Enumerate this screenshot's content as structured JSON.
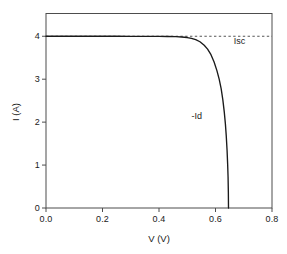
{
  "chart_data": {
    "type": "line",
    "title": "",
    "xlabel": "V (V)",
    "ylabel": "I (A)",
    "xlim": [
      0.0,
      0.8
    ],
    "ylim": [
      0.0,
      4.53
    ],
    "xticks": [
      "0.0",
      "0.2",
      "0.4",
      "0.6",
      "0.8"
    ],
    "xtick_values": [
      0.0,
      0.2,
      0.4,
      0.6,
      0.8
    ],
    "yticks": [
      "0",
      "1",
      "2",
      "3",
      "4"
    ],
    "ytick_values": [
      0,
      1,
      2,
      3,
      4
    ],
    "grid": false,
    "legend": "none",
    "series": [
      {
        "name": "-Id",
        "style": "solid",
        "color": "#1a1a1a",
        "x": [
          0.0,
          0.05,
          0.1,
          0.15,
          0.2,
          0.25,
          0.3,
          0.35,
          0.4,
          0.43,
          0.46,
          0.48,
          0.5,
          0.515,
          0.53,
          0.545,
          0.56,
          0.572,
          0.584,
          0.595,
          0.605,
          0.613,
          0.62,
          0.626,
          0.631,
          0.635,
          0.638,
          0.641,
          0.643,
          0.6445,
          0.6455,
          0.646
        ],
        "y": [
          4.0,
          4.0,
          4.0,
          4.0,
          4.0,
          4.0,
          3.999,
          3.999,
          3.997,
          3.995,
          3.99,
          3.983,
          3.97,
          3.952,
          3.922,
          3.872,
          3.79,
          3.7,
          3.57,
          3.4,
          3.2,
          3.0,
          2.78,
          2.52,
          2.24,
          1.96,
          1.69,
          1.34,
          1.02,
          0.72,
          0.37,
          0.0
        ]
      },
      {
        "name": "Isc",
        "style": "dashed",
        "color": "#555555",
        "x": [
          0.0,
          0.8
        ],
        "y": [
          4.0,
          4.0
        ]
      }
    ],
    "annotations": [
      {
        "text": "Isc",
        "x": 0.665,
        "y": 3.88
      },
      {
        "text": "-Id",
        "x": 0.515,
        "y": 2.14
      }
    ]
  },
  "axes": {
    "x_title": "V (V)",
    "y_title": "I (A)",
    "x_tick_labels": [
      "0.0",
      "0.2",
      "0.4",
      "0.6",
      "0.8"
    ],
    "y_tick_labels": [
      "0",
      "1",
      "2",
      "3",
      "4"
    ]
  },
  "annotations": {
    "isc": "Isc",
    "id": "-Id"
  },
  "colors": {
    "curve": "#1a1a1a",
    "dashed": "#555555",
    "frame": "#4d4d4d",
    "background": "#ffffff",
    "text": "#1a1a1a"
  }
}
